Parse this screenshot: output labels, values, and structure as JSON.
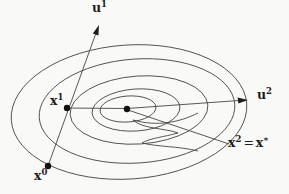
{
  "figure": {
    "kind": "contour-diagram",
    "contour_count": 5,
    "labels": {
      "u1": {
        "base": "u",
        "sup": "1"
      },
      "u2": {
        "base": "u",
        "sup": "2"
      },
      "x1": {
        "base": "x",
        "sup": "1"
      },
      "x0": {
        "base": "x",
        "sup": "0"
      },
      "x2": {
        "base": "x",
        "sup": "2",
        "eq": "=",
        "base2": "x",
        "sup2": "∗"
      }
    },
    "points": [
      {
        "name": "x0-point"
      },
      {
        "name": "x1-point"
      },
      {
        "name": "x2-center-point"
      }
    ],
    "colors": {
      "line": "#454545",
      "text": "#1c1c1c",
      "dot": "#121212",
      "background": "#f9f9f8"
    }
  }
}
